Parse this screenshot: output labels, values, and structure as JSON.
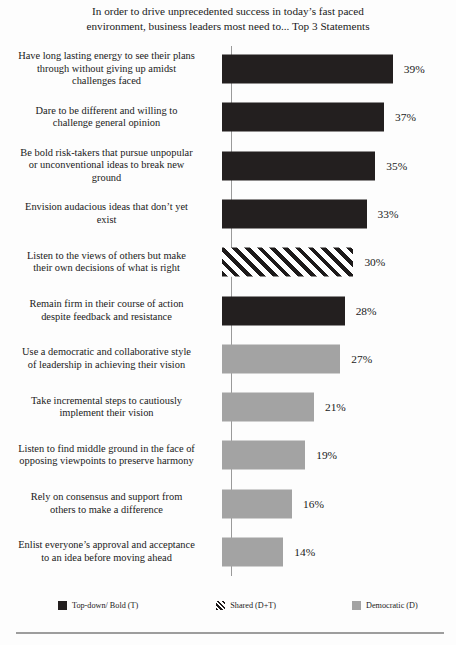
{
  "chart_data": {
    "type": "bar",
    "orientation": "horizontal",
    "title_lines": [
      "In order to drive unprecedented success in today’s fast paced",
      "environment, business leaders most need to... Top 3 Statements"
    ],
    "xlabel": "",
    "ylabel": "",
    "xlim": [
      0,
      42
    ],
    "grid": false,
    "value_suffix": "%",
    "categories": [
      "Have long lasting energy to see their plans through without giving up amidst challenges faced",
      "Dare to be different and willing to challenge  general opinion",
      "Be bold risk-takers  that pursue unpopular or unconventional ideas to break new ground",
      "Envision audacious ideas that don’t  yet exist",
      "Listen to the views of others but make their own decisions of what is right",
      "Remain firm in their course of action despite feedback and resistance",
      "Use a democratic and collaborative style of leadership  in achieving their vision",
      "Take incremental steps to cautiously implement their vision",
      "Listen to find middle ground in the face of opposing viewpoints  to preserve harmony",
      "Rely on consensus and support from others to make a difference",
      "Enlist everyone’s approval and acceptance to an idea before moving ahead"
    ],
    "values": [
      39,
      37,
      35,
      33,
      30,
      28,
      27,
      21,
      19,
      16,
      14
    ],
    "value_labels": [
      "39%",
      "37%",
      "35%",
      "33%",
      "30%",
      "28%",
      "27%",
      "21%",
      "19%",
      "16%",
      "14%"
    ],
    "series_key": [
      "bold",
      "bold",
      "bold",
      "bold",
      "shared",
      "bold",
      "demo",
      "demo",
      "demo",
      "demo",
      "demo"
    ],
    "legend_position": "bottom",
    "legend": [
      {
        "key": "bold",
        "label": "Top-down/ Bold (T)",
        "color": "#231f1f"
      },
      {
        "key": "shared",
        "label": "Shared (D+T)",
        "color": "#1d1a1a"
      },
      {
        "key": "demo",
        "label": "Democratic (D)",
        "color": "#a3a3a3"
      }
    ]
  },
  "bars": [
    {
      "label_lines": [
        "Have long lasting energy to see their plans",
        "through without giving up amidst",
        "challenges faced"
      ],
      "value_label": "39%"
    },
    {
      "label_lines": [
        "Dare to be different and willing to",
        "challenge  general opinion"
      ],
      "value_label": "37%"
    },
    {
      "label_lines": [
        "Be bold risk-takers  that pursue unpopular",
        "or unconventional ideas to break new",
        "ground"
      ],
      "value_label": "35%"
    },
    {
      "label_lines": [
        "Envision audacious ideas that don’t  yet",
        "exist"
      ],
      "value_label": "33%"
    },
    {
      "label_lines": [
        "Listen to the views of others but make",
        "their own decisions of what is right"
      ],
      "value_label": "30%"
    },
    {
      "label_lines": [
        "Remain firm in their course of action",
        "despite feedback and resistance"
      ],
      "value_label": "28%"
    },
    {
      "label_lines": [
        "Use a democratic and collaborative style",
        "of leadership  in achieving their vision"
      ],
      "value_label": "27%"
    },
    {
      "label_lines": [
        "Take incremental steps to cautiously",
        "implement their vision"
      ],
      "value_label": "21%"
    },
    {
      "label_lines": [
        "Listen to find middle ground in the face of",
        "opposing viewpoints  to preserve harmony"
      ],
      "value_label": "19%"
    },
    {
      "label_lines": [
        "Rely on consensus and support from",
        "others to make a difference"
      ],
      "value_label": "16%"
    },
    {
      "label_lines": [
        "Enlist everyone’s approval and acceptance",
        "to an idea before moving ahead"
      ],
      "value_label": "14%"
    }
  ]
}
